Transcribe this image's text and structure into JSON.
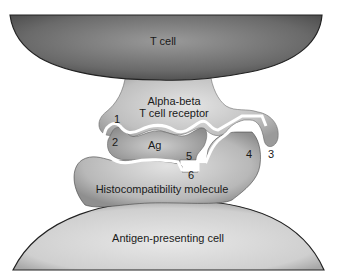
{
  "diagram": {
    "type": "biological-schematic",
    "labels": {
      "t_cell": "T cell",
      "receptor_line1": "Alpha-beta",
      "receptor_line2": "T cell receptor",
      "antigen": "Ag",
      "mhc": "Histocompatibility molecule",
      "apc": "Antigen-presenting cell"
    },
    "contact_numbers": [
      "1",
      "2",
      "3",
      "4",
      "5",
      "6"
    ],
    "colors": {
      "t_cell_dark": "#5a5a5a",
      "t_cell_light": "#9a9a9a",
      "receptor": "#c4c4c4",
      "antigen": "#b0b0b0",
      "mhc": "#bdbdbd",
      "apc": "#d6d6d6",
      "outline": "#222222",
      "groove": "#ffffff"
    }
  }
}
